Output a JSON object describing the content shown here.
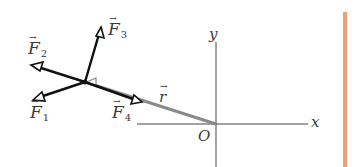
{
  "diagram": {
    "type": "force-torque-vector-diagram",
    "colors": {
      "force_stroke": "#111111",
      "r_vector": "#8a8a8a",
      "axis": "#444444",
      "label": "#3a3a3a",
      "accent_bar": "#f0a070",
      "background": "#ffffff"
    },
    "origin": {
      "label": "O",
      "x": 216,
      "y": 124
    },
    "axes": {
      "x": {
        "label": "x",
        "from": [
          137,
          124
        ],
        "to": [
          308,
          124
        ]
      },
      "y": {
        "label": "y",
        "from": [
          216,
          167
        ],
        "to": [
          216,
          42
        ]
      }
    },
    "application_point": {
      "x": 85,
      "y": 82
    },
    "position_vector": {
      "label": "r",
      "from": [
        216,
        124
      ],
      "to": [
        85,
        82
      ]
    },
    "forces": [
      {
        "name": "F",
        "sub": "1",
        "tip": [
          35,
          99
        ]
      },
      {
        "name": "F",
        "sub": "2",
        "tip": [
          32,
          65
        ]
      },
      {
        "name": "F",
        "sub": "3",
        "tip": [
          101,
          28
        ]
      },
      {
        "name": "F",
        "sub": "4",
        "tip": [
          140,
          102
        ]
      }
    ],
    "labels": {
      "F1": {
        "text": "F",
        "sub": "1",
        "x": 30,
        "y": 114
      },
      "F2": {
        "text": "F",
        "sub": "2",
        "x": 28,
        "y": 41
      },
      "F3": {
        "text": "F",
        "sub": "3",
        "x": 109,
        "y": 22
      },
      "F4": {
        "text": "F",
        "sub": "4",
        "x": 113,
        "y": 106
      },
      "r": {
        "text": "r",
        "x": 159,
        "y": 90
      },
      "O": {
        "text": "O",
        "x": 197,
        "y": 131
      },
      "x": {
        "text": "x",
        "x": 311,
        "y": 116
      },
      "y": {
        "text": "y",
        "x": 209,
        "y": 26
      }
    },
    "accent_bar": {
      "x": 343,
      "y": 12,
      "width": 4,
      "height": 155
    }
  }
}
